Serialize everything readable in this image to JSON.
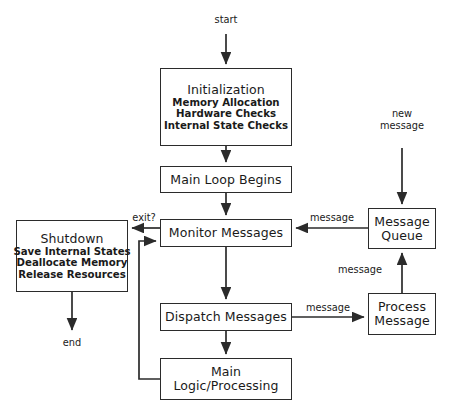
{
  "diagram": {
    "stroke_color": "#2b2b2b",
    "text_color": "#1a1a1a",
    "background": "#ffffff",
    "nodes": [
      {
        "id": "initialization",
        "title": "Initialization",
        "lines": [
          "Memory Allocation",
          "Hardware Checks",
          "Internal State Checks"
        ],
        "x": 160,
        "y": 68,
        "w": 132,
        "h": 78
      },
      {
        "id": "main-loop-begins",
        "title": "Main Loop Begins",
        "lines": [],
        "x": 160,
        "y": 166,
        "w": 132,
        "h": 27
      },
      {
        "id": "monitor-messages",
        "title": "Monitor Messages",
        "lines": [],
        "x": 160,
        "y": 219,
        "w": 132,
        "h": 28
      },
      {
        "id": "shutdown",
        "title": "Shutdown",
        "lines": [
          "Save Internal States",
          "Deallocate Memory",
          "Release Resources"
        ],
        "x": 16,
        "y": 220,
        "w": 112,
        "h": 72
      },
      {
        "id": "message-queue",
        "title": "Message\nQueue",
        "line1": "Message",
        "line2": "Queue",
        "lines": [],
        "x": 368,
        "y": 208,
        "w": 68,
        "h": 41
      },
      {
        "id": "dispatch-messages",
        "title": "Dispatch Messages",
        "lines": [],
        "x": 160,
        "y": 303,
        "w": 132,
        "h": 28
      },
      {
        "id": "process-message",
        "line1": "Process",
        "line2": "Message",
        "lines": [],
        "x": 368,
        "y": 293,
        "w": 68,
        "h": 42
      },
      {
        "id": "main-logic-processing",
        "line1": "Main",
        "line2": "Logic/Processing",
        "lines": [],
        "x": 160,
        "y": 358,
        "w": 132,
        "h": 42
      }
    ],
    "labels": {
      "start": "start",
      "end": "end",
      "new_message_line1": "new",
      "new_message_line2": "message",
      "exit": "exit?",
      "message_queue_to_monitor": "message",
      "dispatch_to_process": "message",
      "process_to_queue": "message"
    }
  }
}
